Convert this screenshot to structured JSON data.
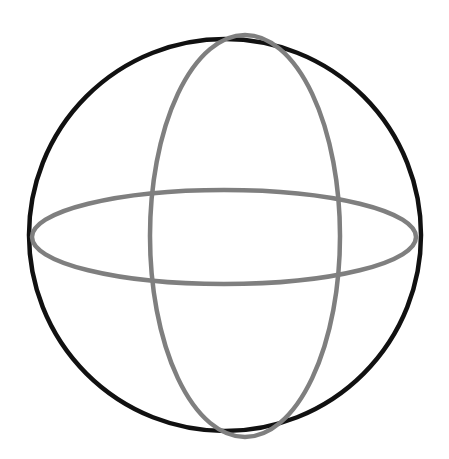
{
  "figure": {
    "name": "wireframe-sphere",
    "canvas": {
      "width": 449,
      "height": 459,
      "background_color": "#ffffff"
    },
    "colors": {
      "outline": "#111111",
      "meridian": "#7f7f7f",
      "equator": "#7f7f7f",
      "background": "#ffffff"
    },
    "shapes": [
      {
        "id": "sphere-outline",
        "label": "Sphere outline circle",
        "type": "circle",
        "cx": 225,
        "cy": 235,
        "r": 196,
        "stroke": "#111111",
        "stroke_width": 4.5,
        "fill": "none"
      },
      {
        "id": "meridian-ellipse",
        "label": "Vertical meridian great circle",
        "type": "ellipse",
        "cx": 245,
        "cy": 236,
        "rx": 95,
        "ry": 201,
        "stroke": "#7f7f7f",
        "stroke_width": 4.5,
        "fill": "none"
      },
      {
        "id": "equator-ellipse",
        "label": "Horizontal equator great circle",
        "type": "ellipse",
        "cx": 224,
        "cy": 237,
        "rx": 192,
        "ry": 47,
        "stroke": "#7f7f7f",
        "stroke_width": 4.5,
        "fill": "none"
      }
    ]
  }
}
